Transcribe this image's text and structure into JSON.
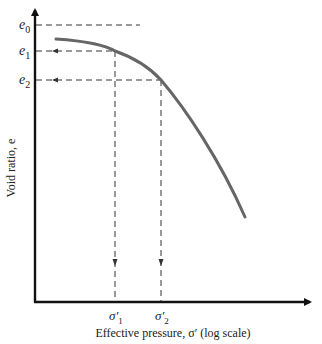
{
  "diagram": {
    "type": "e-log-sigma consolidation curve",
    "y_axis": {
      "label": "Void ratio, e",
      "ticks": [
        {
          "base": "e",
          "sub": "0"
        },
        {
          "base": "e",
          "sub": "1"
        },
        {
          "base": "e",
          "sub": "2"
        }
      ]
    },
    "x_axis": {
      "label": "Effective pressure, σ′ (log scale)",
      "ticks": [
        {
          "base": "σ′",
          "sub": "1"
        },
        {
          "base": "σ′",
          "sub": "2"
        }
      ]
    },
    "colors": {
      "axis": "#111111",
      "curve": "#666666",
      "dashed": "#333333"
    }
  }
}
